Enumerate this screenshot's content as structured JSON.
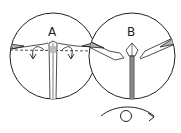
{
  "diagram": {
    "type": "origami-instruction",
    "panels": [
      {
        "label": "A",
        "description": "Valley fold along dashed line, flaps folded down (arrows)"
      },
      {
        "label": "B",
        "description": "Result after folding; shaded wing flaps"
      }
    ],
    "footer": {
      "symbol": "turn-over",
      "description": "Turn model over"
    },
    "colors": {
      "line": "#222222",
      "shade": "#b5b5b5",
      "background": "#ffffff"
    }
  }
}
